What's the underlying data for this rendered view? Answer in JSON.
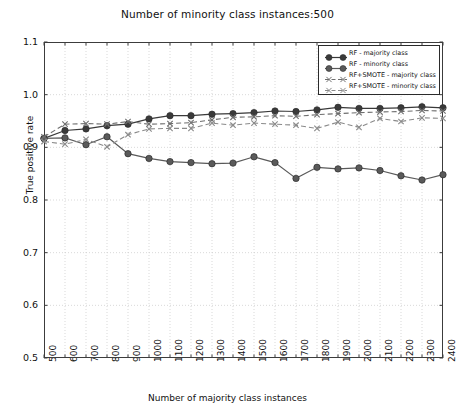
{
  "chart_data": {
    "type": "line",
    "title": "Number of minority class instances:500",
    "xlabel": "Number of majority class instances",
    "ylabel": "True positive rate",
    "x": [
      500,
      600,
      700,
      800,
      900,
      1000,
      1100,
      1200,
      1300,
      1400,
      1500,
      1600,
      1700,
      1800,
      1900,
      2000,
      2100,
      2200,
      2300,
      2400
    ],
    "xlim": [
      500,
      2400
    ],
    "ylim": [
      0.5,
      1.1
    ],
    "yticks": [
      "0.5",
      "0.6",
      "0.7",
      "0.8",
      "0.9",
      "1.0",
      "1.1"
    ],
    "xticks": [
      "500",
      "600",
      "700",
      "800",
      "900",
      "1000",
      "1100",
      "1200",
      "1300",
      "1400",
      "1500",
      "1600",
      "1700",
      "1800",
      "1900",
      "2000",
      "2100",
      "2200",
      "2300",
      "2400"
    ],
    "grid": true,
    "legend_position": "upper right",
    "series": [
      {
        "name": "RF - majority class",
        "marker": "circle",
        "linestyle": "solid",
        "color": "#3a3a3a",
        "values": [
          0.917,
          0.932,
          0.935,
          0.941,
          0.944,
          0.954,
          0.96,
          0.96,
          0.963,
          0.964,
          0.966,
          0.969,
          0.968,
          0.971,
          0.976,
          0.974,
          0.974,
          0.975,
          0.977,
          0.975
        ]
      },
      {
        "name": "RF - minority class",
        "marker": "circle",
        "linestyle": "solid",
        "color": "#5a5a5a",
        "values": [
          0.917,
          0.918,
          0.905,
          0.92,
          0.888,
          0.879,
          0.873,
          0.871,
          0.869,
          0.87,
          0.882,
          0.871,
          0.841,
          0.862,
          0.859,
          0.861,
          0.856,
          0.846,
          0.838,
          0.848
        ]
      },
      {
        "name": "RF+SMOTE - majority class",
        "marker": "x",
        "linestyle": "dashed",
        "color": "#6e6e6e",
        "values": [
          0.92,
          0.944,
          0.945,
          0.944,
          0.949,
          0.944,
          0.945,
          0.947,
          0.952,
          0.957,
          0.958,
          0.96,
          0.959,
          0.962,
          0.964,
          0.966,
          0.967,
          0.968,
          0.97,
          0.969
        ]
      },
      {
        "name": "RF+SMOTE - minority class",
        "marker": "x",
        "linestyle": "dashed",
        "color": "#8a8a8a",
        "values": [
          0.911,
          0.906,
          0.915,
          0.901,
          0.924,
          0.935,
          0.936,
          0.936,
          0.946,
          0.942,
          0.946,
          0.944,
          0.942,
          0.936,
          0.948,
          0.938,
          0.955,
          0.949,
          0.956,
          0.955
        ]
      }
    ]
  },
  "axes": {
    "plot_left": 44,
    "plot_right": 443,
    "plot_top": 42,
    "plot_bottom": 358
  }
}
